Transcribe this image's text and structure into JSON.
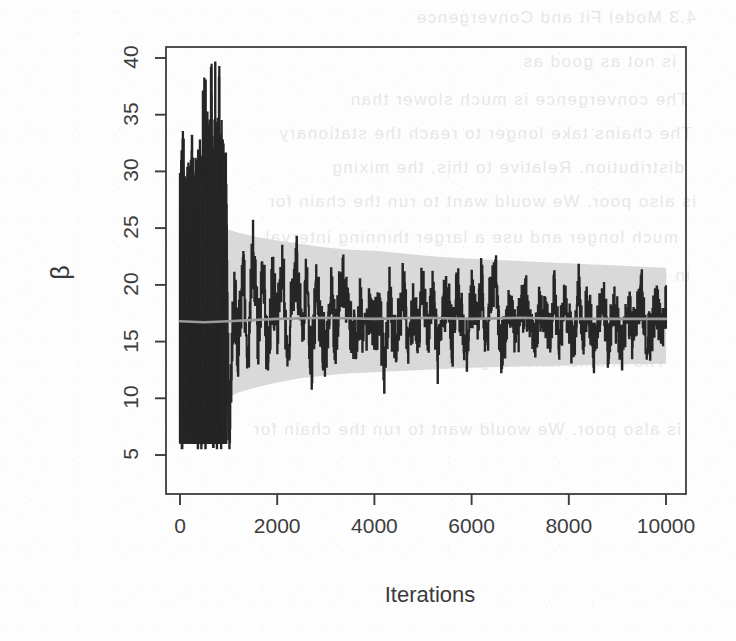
{
  "figure": {
    "kind": "mcmc-trace-plot",
    "source_medium": "scanned-document-page",
    "background_color": "#fdfdfd",
    "ink_color": "#262626",
    "band_color": "#d9d9d9",
    "mean_line_color": "#9a9a9a",
    "axis_color": "#3d3d3d"
  },
  "ghost_text": {
    "note": "faint mirrored bleed-through text visible behind the figure",
    "lines": [
      "is not as good as",
      "The convergence is much slower than",
      "The chains take longer to reach the stationary",
      "distribution. Relative to this, the mixing",
      "is also poor. We would want to run the chain for",
      "much longer and use a larger thinning interval",
      "in order to obtain an acceptable effective sample size.",
      "4.3 Model Fit and Convergence"
    ]
  },
  "chart_data": {
    "type": "line",
    "title": "",
    "xlabel": "Iterations",
    "ylabel": "β",
    "xlim": [
      0,
      10000
    ],
    "ylim": [
      5,
      40
    ],
    "grid": false,
    "legend": null,
    "xticks": [
      0,
      2000,
      4000,
      6000,
      8000,
      10000
    ],
    "xtick_labels": [
      "0",
      "2000",
      "4000",
      "6000",
      "8000",
      "10000"
    ],
    "yticks": [
      5,
      10,
      15,
      20,
      25,
      30,
      35,
      40
    ],
    "ytick_labels": [
      "5",
      "10",
      "15",
      "20",
      "25",
      "30",
      "35",
      "40"
    ],
    "series": [
      {
        "name": "beta trace",
        "role": "mcmc-chain",
        "color": "#262626",
        "description": "Step-function MCMC sample path for beta; dense high-variance burn-in over iterations 0-950, then stabilised sampling.",
        "x": [
          0,
          40,
          80,
          120,
          160,
          200,
          240,
          280,
          320,
          360,
          400,
          440,
          480,
          520,
          560,
          600,
          640,
          680,
          720,
          760,
          800,
          840,
          880,
          920,
          960,
          1000,
          1100,
          1200,
          1300,
          1400,
          1500,
          1600,
          1700,
          1800,
          1900,
          2000,
          2100,
          2200,
          2300,
          2400,
          2500,
          2600,
          2700,
          2800,
          2900,
          3000,
          3100,
          3200,
          3300,
          3400,
          3500,
          3600,
          3700,
          3800,
          3900,
          4000,
          4100,
          4200,
          4300,
          4400,
          4500,
          4600,
          4700,
          4800,
          4900,
          5000,
          5100,
          5200,
          5300,
          5400,
          5500,
          5600,
          5700,
          5800,
          5900,
          6000,
          6100,
          6200,
          6300,
          6400,
          6500,
          6600,
          6700,
          6800,
          6900,
          7000,
          7100,
          7200,
          7300,
          7400,
          7500,
          7600,
          7700,
          7800,
          7900,
          8000,
          8100,
          8200,
          8300,
          8400,
          8500,
          8600,
          8700,
          8800,
          8900,
          9000,
          9100,
          9200,
          9300,
          9400,
          9500,
          9600,
          9700,
          9800,
          9900,
          10000
        ],
        "y": [
          16.8,
          9.2,
          24.0,
          8.5,
          27.5,
          11.0,
          30.4,
          9.5,
          22.0,
          12.5,
          29.0,
          8.8,
          31.0,
          10.2,
          26.0,
          13.0,
          32.0,
          9.0,
          39.5,
          8.0,
          30.5,
          12.0,
          28.0,
          7.5,
          24.5,
          6.3,
          19.0,
          14.5,
          21.0,
          13.5,
          23.5,
          15.0,
          22.5,
          13.0,
          20.0,
          16.0,
          23.0,
          14.0,
          18.5,
          21.5,
          15.5,
          20.5,
          13.2,
          19.5,
          16.2,
          14.0,
          20.0,
          15.0,
          20.2,
          19.8,
          16.5,
          15.2,
          18.0,
          14.8,
          19.0,
          16.0,
          17.5,
          13.0,
          19.2,
          15.0,
          16.8,
          20.0,
          14.2,
          18.0,
          16.0,
          20.5,
          15.5,
          19.0,
          13.5,
          17.2,
          19.5,
          15.0,
          20.0,
          16.5,
          14.5,
          18.8,
          16.0,
          20.2,
          15.0,
          19.8,
          20.4,
          14.0,
          16.2,
          18.0,
          15.5,
          17.0,
          19.0,
          16.0,
          14.8,
          18.2,
          17.5,
          16.0,
          19.0,
          15.2,
          18.0,
          16.5,
          14.5,
          19.5,
          16.0,
          18.5,
          14.0,
          17.0,
          19.2,
          15.0,
          18.0,
          16.5,
          14.2,
          18.8,
          15.5,
          17.5,
          19.0,
          14.8,
          16.0,
          18.5,
          15.2,
          18.6
        ]
      },
      {
        "name": "running posterior mean",
        "role": "mean-line",
        "color": "#9a9a9a",
        "description": "Smooth grey running-mean line through the chain, flat at approximately 17.",
        "x": [
          0,
          500,
          1000,
          2000,
          3000,
          4000,
          5000,
          6000,
          7000,
          8000,
          9000,
          10000
        ],
        "y": [
          16.8,
          16.7,
          16.8,
          17.0,
          17.1,
          17.0,
          17.1,
          17.0,
          17.1,
          17.0,
          17.0,
          17.0
        ]
      }
    ],
    "band": {
      "name": "running credible interval",
      "color": "#d9d9d9",
      "description": "Grey shaded running credible band that contracts as the number of iterations grows.",
      "x": [
        900,
        1200,
        1600,
        2000,
        2500,
        3000,
        3500,
        4000,
        4500,
        5000,
        5500,
        6000,
        6500,
        7000,
        7500,
        8000,
        8500,
        9000,
        9500,
        10000
      ],
      "upper": [
        25.0,
        24.6,
        24.2,
        23.9,
        23.6,
        23.3,
        23.1,
        23.0,
        22.8,
        22.6,
        22.4,
        22.3,
        22.2,
        22.1,
        22.0,
        21.9,
        21.8,
        21.7,
        21.6,
        21.5
      ],
      "lower": [
        9.9,
        10.5,
        11.0,
        11.4,
        11.8,
        12.0,
        12.2,
        12.3,
        12.4,
        12.5,
        12.6,
        12.7,
        12.75,
        12.8,
        12.85,
        12.9,
        12.95,
        13.0,
        13.0,
        13.05
      ]
    }
  }
}
